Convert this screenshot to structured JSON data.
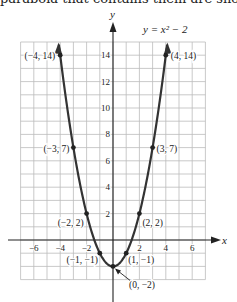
{
  "header_fragment": "parabola that contains them are shown",
  "chart_data": {
    "type": "line",
    "title": "y = x² − 2",
    "equation": "y = x^2 - 2",
    "xlabel": "x",
    "ylabel": "y",
    "xlim": [
      -7,
      7
    ],
    "ylim": [
      -3,
      15
    ],
    "grid": true,
    "x_ticks": [
      -6,
      -4,
      -2,
      2,
      4,
      6
    ],
    "y_ticks": [
      2,
      4,
      6,
      8,
      10,
      12,
      14
    ],
    "x_tick_labels": [
      "−6",
      "−4",
      "−2",
      "2",
      "4",
      "6"
    ],
    "y_tick_labels": [
      "2",
      "4",
      "6",
      "8",
      "10",
      "12",
      "14"
    ],
    "points": [
      {
        "x": -4,
        "y": 14,
        "label": "(−4, 14)"
      },
      {
        "x": -3,
        "y": 7,
        "label": "(−3, 7)"
      },
      {
        "x": -2,
        "y": 2,
        "label": "(−2, 2)"
      },
      {
        "x": -1,
        "y": -1,
        "label": "(−1, −1)"
      },
      {
        "x": 0,
        "y": -2,
        "label": "(0, −2)"
      },
      {
        "x": 1,
        "y": -1,
        "label": "(1, −1)"
      },
      {
        "x": 2,
        "y": 2,
        "label": "(2, 2)"
      },
      {
        "x": 3,
        "y": 7,
        "label": "(3, 7)"
      },
      {
        "x": 4,
        "y": 14,
        "label": "(4, 14)"
      }
    ],
    "curve_color": "#333333",
    "grid_color": "#bbbbbb"
  }
}
